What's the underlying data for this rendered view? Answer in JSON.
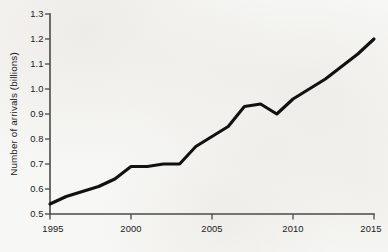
{
  "chart_data": {
    "type": "line",
    "title": "",
    "subtitle": "",
    "xlabel": "",
    "ylabel": "Number of arrivals (billions)",
    "xlim": [
      1995,
      2015
    ],
    "ylim": [
      0.5,
      1.3
    ],
    "grid": false,
    "legend": null,
    "x_tick_labels": [
      "1995",
      "2000",
      "2005",
      "2010",
      "2015"
    ],
    "x_tick_values": [
      1995,
      2000,
      2005,
      2010,
      2015
    ],
    "y_tick_labels": [
      "0.5",
      "0.6",
      "0.7",
      "0.8",
      "0.9",
      "1.0",
      "1.1",
      "1.2",
      "1.3"
    ],
    "y_tick_values": [
      0.5,
      0.6,
      0.7,
      0.8,
      0.9,
      1.0,
      1.1,
      1.2,
      1.3
    ],
    "x": [
      1995,
      1996,
      1997,
      1998,
      1999,
      2000,
      2001,
      2002,
      2003,
      2004,
      2005,
      2006,
      2007,
      2008,
      2009,
      2010,
      2011,
      2012,
      2013,
      2014,
      2015
    ],
    "values": [
      0.54,
      0.57,
      0.59,
      0.61,
      0.64,
      0.69,
      0.69,
      0.7,
      0.7,
      0.77,
      0.81,
      0.85,
      0.93,
      0.94,
      0.9,
      0.96,
      1.0,
      1.04,
      1.09,
      1.14,
      1.2
    ],
    "series": [
      {
        "name": "International tourist arrivals",
        "values": [
          0.54,
          0.57,
          0.59,
          0.61,
          0.64,
          0.69,
          0.69,
          0.7,
          0.7,
          0.77,
          0.81,
          0.85,
          0.93,
          0.94,
          0.9,
          0.96,
          1.0,
          1.04,
          1.09,
          1.14,
          1.2
        ]
      }
    ],
    "line_color": "#111110",
    "axis_color": "#4a4a48",
    "background_color": "#f7f7f5"
  },
  "figure": {
    "y_axis_title": "Number of arrivals (billions)"
  }
}
